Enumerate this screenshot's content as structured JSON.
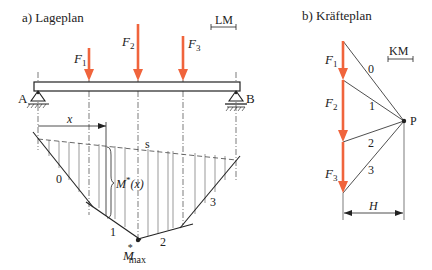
{
  "colors": {
    "force": "#f0643c",
    "line": "#222222",
    "hatch": "#555555",
    "background": "#ffffff"
  },
  "lageplan": {
    "title": "a) Lageplan",
    "scale_label": "LM",
    "support_a": "A",
    "support_b": "B",
    "forces": [
      {
        "name": "F",
        "sub": "1"
      },
      {
        "name": "F",
        "sub": "2"
      },
      {
        "name": "F",
        "sub": "3"
      }
    ],
    "x_label": "x",
    "closing_line_label": "s",
    "moment_label": "M*(x)",
    "moment_label_main": "M",
    "moment_label_sup": "*",
    "moment_label_arg": "(x)",
    "max_label_main": "M",
    "max_label_sup": "*",
    "max_label_sub": "max",
    "rope_segments": [
      "0",
      "1",
      "2",
      "3"
    ]
  },
  "kraefteplan": {
    "title": "b) Kräfteplan",
    "scale_label": "KM",
    "pole_label": "P",
    "forces": [
      {
        "name": "F",
        "sub": "1"
      },
      {
        "name": "F",
        "sub": "2"
      },
      {
        "name": "F",
        "sub": "3"
      }
    ],
    "rays": [
      "0",
      "1",
      "2",
      "3"
    ],
    "pole_distance_label": "H"
  }
}
